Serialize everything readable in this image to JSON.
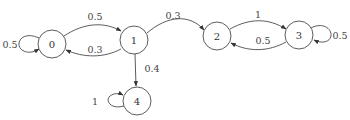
{
  "diagram": {
    "type": "markov-chain",
    "nodes": [
      {
        "id": "0",
        "label": "0",
        "cx": 52,
        "cy": 44
      },
      {
        "id": "1",
        "label": "1",
        "cx": 134,
        "cy": 40
      },
      {
        "id": "2",
        "label": "2",
        "cx": 217,
        "cy": 36
      },
      {
        "id": "3",
        "label": "3",
        "cx": 299,
        "cy": 35
      },
      {
        "id": "4",
        "label": "4",
        "cx": 137,
        "cy": 101
      }
    ],
    "edges": [
      {
        "from": "0",
        "to": "0",
        "label": "0.5"
      },
      {
        "from": "0",
        "to": "1",
        "label": "0.5"
      },
      {
        "from": "1",
        "to": "0",
        "label": "0.3"
      },
      {
        "from": "1",
        "to": "2",
        "label": "0.3"
      },
      {
        "from": "1",
        "to": "4",
        "label": "0.4"
      },
      {
        "from": "2",
        "to": "3",
        "label": "1"
      },
      {
        "from": "3",
        "to": "2",
        "label": "0.5"
      },
      {
        "from": "3",
        "to": "3",
        "label": "0.5"
      },
      {
        "from": "4",
        "to": "4",
        "label": "1"
      }
    ]
  }
}
